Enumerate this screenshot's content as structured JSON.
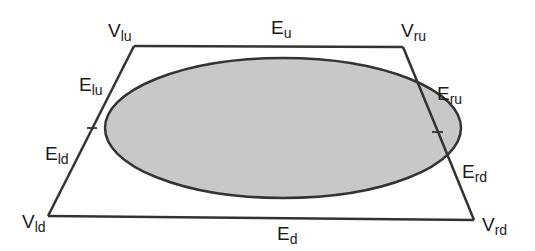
{
  "diagram": {
    "type": "trapezoid-with-ellipse",
    "colors": {
      "stroke": "#333333",
      "ellipse_fill": "#c8c8c8",
      "background": "#ffffff",
      "text": "#1a1a1a"
    },
    "trapezoid": {
      "vertices": {
        "lu": {
          "x": 134,
          "y": 46
        },
        "ru": {
          "x": 403,
          "y": 47
        },
        "rd": {
          "x": 474,
          "y": 220
        },
        "ld": {
          "x": 48,
          "y": 216
        }
      }
    },
    "ellipse": {
      "cx": 283,
      "cy": 128,
      "rx": 178,
      "ry": 70
    },
    "labels": {
      "V_lu": {
        "base": "V",
        "sub": "lu"
      },
      "V_ru": {
        "base": "V",
        "sub": "ru"
      },
      "V_ld": {
        "base": "V",
        "sub": "ld"
      },
      "V_rd": {
        "base": "V",
        "sub": "rd"
      },
      "E_u": {
        "base": "E",
        "sub": "u"
      },
      "E_d": {
        "base": "E",
        "sub": "d"
      },
      "E_lu": {
        "base": "E",
        "sub": "lu"
      },
      "E_ld": {
        "base": "E",
        "sub": "ld"
      },
      "E_ru": {
        "base": "E",
        "sub": "ru"
      },
      "E_rd": {
        "base": "E",
        "sub": "rd"
      }
    }
  }
}
